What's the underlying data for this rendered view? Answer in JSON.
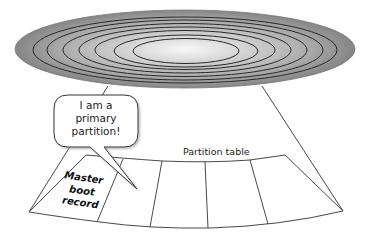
{
  "diagram": {
    "disk": {
      "track_count": 7,
      "fill_outer": "#8a8a8a",
      "fill_inner": "#f7f7f7",
      "track_color": "#2a2a2a"
    },
    "speech_bubble": {
      "lines": [
        "I am a",
        "primary",
        "partition!"
      ]
    },
    "labels": {
      "partition_table": "Partition table",
      "mbr_lines": [
        "Master",
        "boot",
        "record"
      ]
    },
    "sector": {
      "cell_count": 5,
      "line_color": "#333333"
    }
  }
}
